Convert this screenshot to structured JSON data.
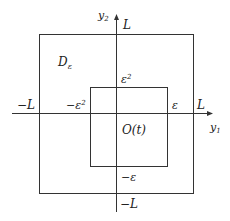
{
  "diagram": {
    "axes": {
      "x_label": "y",
      "x_sub": "1",
      "y_label": "y",
      "y_sub": "2"
    },
    "outer_box": {
      "label_main": "D",
      "label_sub": "ε",
      "right_label": "L",
      "left_label": "−L",
      "top_label": "L",
      "bottom_label": "−L"
    },
    "inner_box": {
      "label": "O(t)",
      "top_label": "ε",
      "top_sup": "2",
      "left_label": "−ε",
      "left_sup": "2",
      "right_label": "ε",
      "bottom_label": "−ε"
    },
    "colors": {
      "line": "#333333",
      "background": "#ffffff"
    }
  }
}
